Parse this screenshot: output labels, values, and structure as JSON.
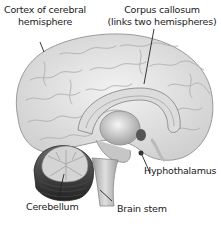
{
  "diagram": {
    "type": "anatomical-illustration",
    "labels": [
      {
        "id": "cortex",
        "line1": "Cortex of cerebral",
        "line2": "hemisphere"
      },
      {
        "id": "corpus",
        "line1": "Corpus callosum",
        "line2": "(links two hemispheres)"
      },
      {
        "id": "hypothalamus",
        "line1": "Hyphothalamus"
      },
      {
        "id": "cerebellum",
        "line1": "Cerebellum"
      },
      {
        "id": "brainstem",
        "line1": "Brain stem"
      }
    ],
    "colors": {
      "cortex": "#e6e6e6",
      "gyri_lines": "#b5b5b5",
      "inner": "#d2d2d2",
      "cerebellum_dark": "#3a3a3a",
      "cerebellum_light": "#cfcfcf",
      "leader_line": "#222222"
    }
  }
}
